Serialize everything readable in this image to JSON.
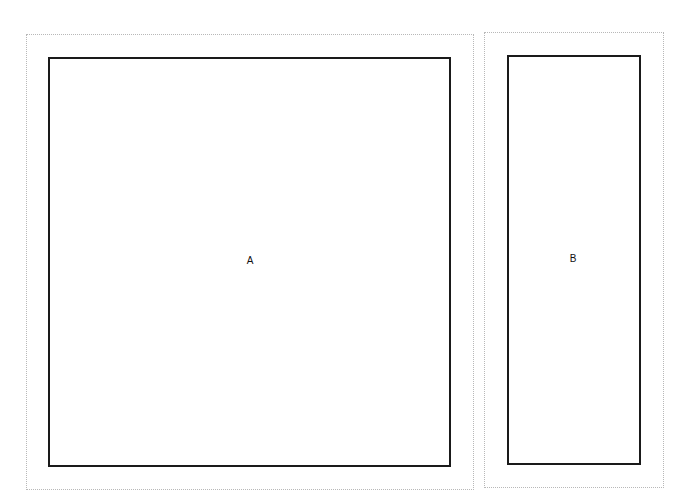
{
  "diagram": {
    "panels": [
      {
        "id": "A",
        "label": "A",
        "outer_border_style": "dotted",
        "outer_border_color": "#b8b8b8",
        "inner_border_style": "solid",
        "inner_border_color": "#1a1a1a"
      },
      {
        "id": "B",
        "label": "B",
        "outer_border_style": "dotted",
        "outer_border_color": "#b8b8b8",
        "inner_border_style": "solid",
        "inner_border_color": "#1a1a1a"
      }
    ]
  }
}
